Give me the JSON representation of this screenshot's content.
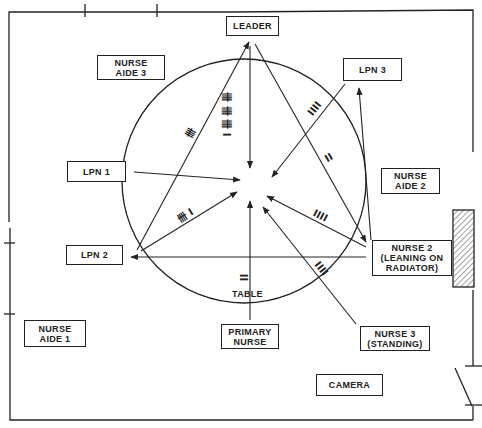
{
  "room": {
    "colors": {
      "line": "#222222",
      "radiator_hatch": "#444444",
      "background": "#ffffff"
    }
  },
  "participants": [
    {
      "id": "leader",
      "line1": "LEADER",
      "line2": ""
    },
    {
      "id": "nurse_aide_3",
      "line1": "NURSE",
      "line2": "AIDE 3"
    },
    {
      "id": "lpn_3",
      "line1": "LPN 3",
      "line2": ""
    },
    {
      "id": "lpn_1",
      "line1": "LPN 1",
      "line2": ""
    },
    {
      "id": "nurse_aide_2",
      "line1": "NURSE",
      "line2": "AIDE 2"
    },
    {
      "id": "lpn_2",
      "line1": "LPN 2",
      "line2": ""
    },
    {
      "id": "nurse_2",
      "line1": "NURSE 2",
      "line2": "(LEANING ON",
      "line3": "RADIATOR)"
    },
    {
      "id": "nurse_aide_1",
      "line1": "NURSE",
      "line2": "AIDE 1"
    },
    {
      "id": "primary_nurse",
      "line1": "PRIMARY",
      "line2": "NURSE"
    },
    {
      "id": "nurse_3",
      "line1": "NURSE 3",
      "line2": "(STANDING)"
    },
    {
      "id": "camera",
      "line1": "CAMERA",
      "line2": ""
    }
  ],
  "table_label": "TABLE",
  "tallies": {
    "leader_to_center": "卌 卌 卌 I",
    "nurse_aide_3_line": "卌",
    "lpn_3_line": "IIII",
    "leader_to_nurse_2": "II",
    "lpn_2_to_center": "卌 I",
    "nurse_2_to_center": "IIII",
    "nurse_3_to_center": "IIII",
    "primary_nurse_to_center": "II"
  },
  "tally_counts": {
    "leader_to_center": 16,
    "nurse_aide_3_line": 5,
    "lpn_3_line": 4,
    "leader_to_nurse_2": 2,
    "lpn_2_to_center": 6,
    "nurse_2_to_center": 4,
    "nurse_3_to_center": 4,
    "primary_nurse_to_center": 2
  }
}
